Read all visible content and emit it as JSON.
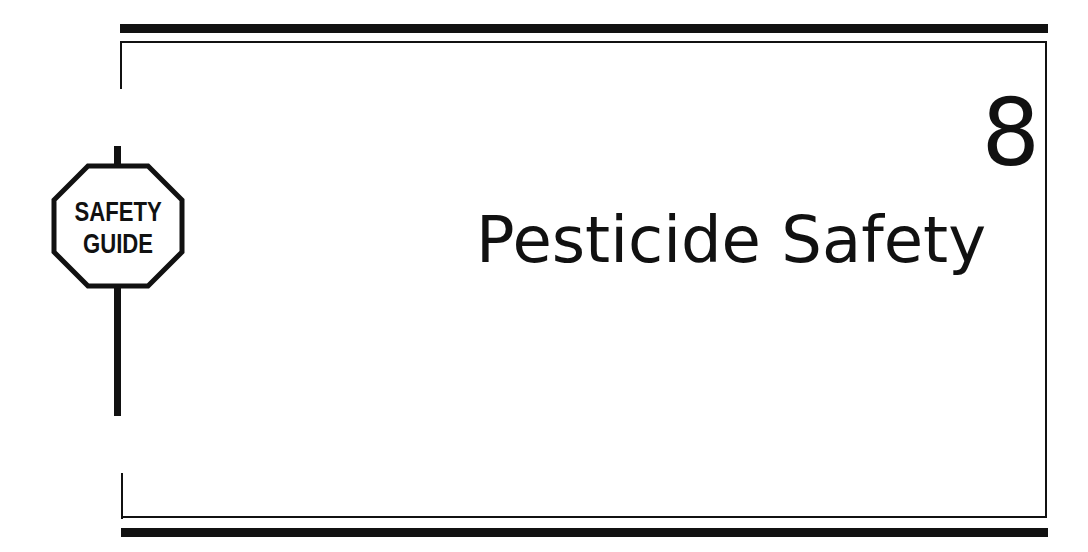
{
  "chapter": {
    "number": "8",
    "title": "Pesticide Safety"
  },
  "sign": {
    "line1": "SAFETY",
    "line2": "GUIDE",
    "icon": "octagon-sign-icon"
  },
  "colors": {
    "ink": "#111111",
    "paper": "#ffffff"
  }
}
